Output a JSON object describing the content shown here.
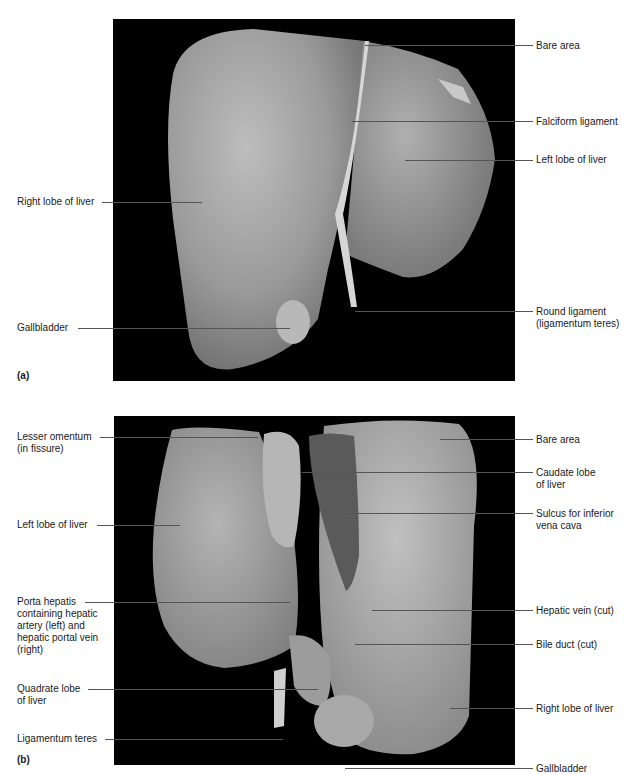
{
  "figure": {
    "panels": [
      {
        "letter": "(a)",
        "view": "anterior",
        "labels_left": [
          {
            "text": "Right lobe of liver"
          },
          {
            "text": "Gallbladder"
          }
        ],
        "labels_right": [
          {
            "text": "Bare area"
          },
          {
            "text": "Falciform ligament"
          },
          {
            "text": "Left lobe of liver"
          },
          {
            "line1": "Round ligament",
            "line2": "(ligamentum teres)"
          }
        ]
      },
      {
        "letter": "(b)",
        "view": "posteroinferior",
        "labels_left": [
          {
            "line1": "Lesser omentum",
            "line2": "(in fissure)"
          },
          {
            "text": "Left lobe of liver"
          },
          {
            "line1": "Porta hepatis",
            "line2": "containing hepatic",
            "line3": "artery (left) and",
            "line4": "hepatic portal vein",
            "line5": "(right)"
          },
          {
            "line1": "Quadrate lobe",
            "line2": "of liver"
          },
          {
            "text": "Ligamentum teres"
          }
        ],
        "labels_right": [
          {
            "text": "Bare area"
          },
          {
            "line1": "Caudate lobe",
            "line2": "of liver"
          },
          {
            "line1": "Sulcus for inferior",
            "line2": "vena cava"
          },
          {
            "text": "Hepatic vein (cut)"
          },
          {
            "text": "Bile duct (cut)"
          },
          {
            "text": "Right lobe of liver"
          },
          {
            "text": "Gallbladder"
          }
        ]
      }
    ],
    "colors": {
      "background": "#ffffff",
      "photo_background": "#000000",
      "leader_line": "#555555",
      "tissue": "#9a9a9a"
    }
  }
}
